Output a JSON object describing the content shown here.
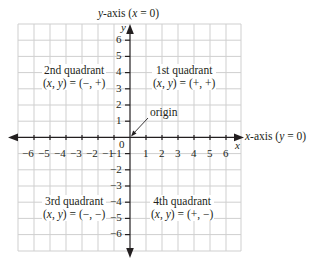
{
  "diagram": {
    "y_axis_label_prefix": "y",
    "y_axis_label_suffix": "-axis (",
    "y_axis_label_eq_var": "x",
    "y_axis_label_eq_rest": " = 0)",
    "x_axis_label_prefix": "x",
    "x_axis_label_suffix": "-axis (",
    "x_axis_label_eq_var": "y",
    "x_axis_label_eq_rest": " = 0)",
    "y_var": "y",
    "x_var": "x",
    "origin_label": "origin",
    "origin_value": "0",
    "x_ticks": [
      "−6",
      "−5",
      "−4",
      "−3",
      "−2",
      "−1",
      "1",
      "2",
      "3",
      "4",
      "5",
      "6"
    ],
    "y_ticks_pos": [
      "6",
      "5",
      "4",
      "3",
      "2",
      "1"
    ],
    "y_ticks_neg": [
      "−1",
      "−2",
      "−3",
      "−4",
      "−5",
      "−6"
    ],
    "quadrants": [
      {
        "name": "1st quadrant",
        "sign": "(+, +)"
      },
      {
        "name": "2nd quadrant",
        "sign": "(−, +)"
      },
      {
        "name": "3rd quadrant",
        "sign": "(−, −)"
      },
      {
        "name": "4th quadrant",
        "sign": "(+, −)"
      }
    ],
    "xy_prefix_x": "x",
    "xy_prefix_y": "y",
    "colors": {
      "grid": "#c8c8c8",
      "axis": "#231f20",
      "text": "#231f20"
    }
  }
}
